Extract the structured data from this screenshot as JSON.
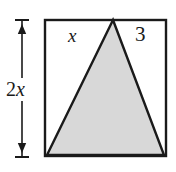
{
  "figure": {
    "type": "geometry-diagram",
    "background_color": "#ffffff",
    "stroke_color": "#1a1a1a",
    "fill_color": "#d8d8d8",
    "rectangle": {
      "name": "outer-rectangle",
      "left": 45,
      "top": 20,
      "right": 166,
      "bottom": 156,
      "stroke_width": 2.4
    },
    "triangle": {
      "name": "shaded-triangle",
      "apex": [
        113,
        20
      ],
      "bottom_left": [
        47,
        155
      ],
      "bottom_right": [
        164,
        155
      ],
      "stroke_width": 2.4,
      "fill": "#d8d8d8"
    },
    "dimension_line": {
      "name": "height-dimension",
      "x": 22,
      "top": 20,
      "bottom": 157,
      "cap_half_width": 7,
      "arrow_size": 5,
      "stroke_width": 1.6
    },
    "labels": {
      "top_left": "x",
      "top_right": "3",
      "left_height": {
        "coefficient": "2",
        "variable": "x",
        "full": "2x"
      }
    }
  }
}
